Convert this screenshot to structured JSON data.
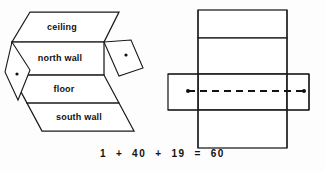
{
  "figure": {
    "clipped_top_caption": "",
    "equation": "1  +  40  +  19  =  60",
    "left_diagram": {
      "name": "unfolded-room-net",
      "faces": [
        {
          "id": "ceiling",
          "label": "ceiling",
          "shape": "parallelogram"
        },
        {
          "id": "north-wall",
          "label": "north wall",
          "shape": "rectangle"
        },
        {
          "id": "floor",
          "label": "floor",
          "shape": "parallelogram"
        },
        {
          "id": "south-wall",
          "label": "south wall",
          "shape": "parallelogram"
        },
        {
          "id": "west-wall",
          "label": "",
          "shape": "diamond"
        },
        {
          "id": "east-wall",
          "label": "",
          "shape": "diamond"
        }
      ],
      "markers": [
        {
          "id": "west-wall-dot",
          "type": "dot"
        },
        {
          "id": "east-wall-dot",
          "type": "dot"
        }
      ]
    },
    "right_diagram": {
      "name": "box-net-cross",
      "faces": [
        {
          "id": "top-panel",
          "shape": "rectangle"
        },
        {
          "id": "upper-middle-panel",
          "shape": "rectangle"
        },
        {
          "id": "center-panel",
          "shape": "rectangle"
        },
        {
          "id": "bottom-panel",
          "shape": "rectangle"
        },
        {
          "id": "left-flap",
          "shape": "rectangle"
        },
        {
          "id": "right-flap",
          "shape": "rectangle"
        }
      ],
      "path": {
        "id": "dashed-route",
        "style": "dashed",
        "endpoints": [
          {
            "id": "route-start-dot",
            "type": "dot"
          },
          {
            "id": "route-end-dot",
            "type": "dot"
          }
        ]
      }
    }
  },
  "colors": {
    "ink": "#111111",
    "stroke": "#1a1a1a",
    "paper": "#fdfdfd"
  }
}
